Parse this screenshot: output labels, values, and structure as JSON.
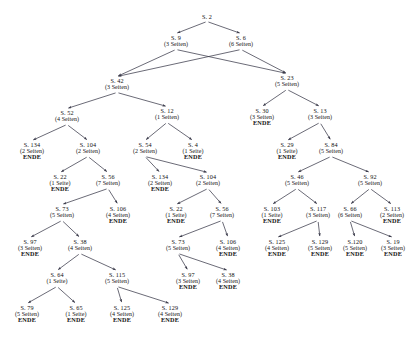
{
  "figure": {
    "caption_top": "",
    "caption_bottom": "",
    "edge_color": "#3a3a4a",
    "text_color": "#111111",
    "background_color": "#ffffff",
    "end_marker_label": "ENDE"
  },
  "chart_data": {
    "type": "tree",
    "title": "",
    "node_label_prefix": "S.",
    "pages_unit_singular": "Seite",
    "pages_unit_plural": "Seiten",
    "terminal_label": "ENDE"
  },
  "nodes": [
    {
      "id": "n0",
      "label": "S. 2",
      "pages": "",
      "end": "",
      "x": 207,
      "y": 14
    },
    {
      "id": "n1",
      "label": "S. 9",
      "pages": "(3 Seiten)",
      "end": "",
      "x": 176,
      "y": 35
    },
    {
      "id": "n2",
      "label": "S. 6",
      "pages": "(6 Seiten)",
      "end": "",
      "x": 241,
      "y": 35
    },
    {
      "id": "n3",
      "label": "S. 42",
      "pages": "(3 Seiten)",
      "end": "",
      "x": 117,
      "y": 78
    },
    {
      "id": "n4",
      "label": "S. 23",
      "pages": "(5 Seiten)",
      "end": "",
      "x": 287,
      "y": 75
    },
    {
      "id": "n5",
      "label": "S. 52",
      "pages": "(4 Seiten)",
      "end": "",
      "x": 67,
      "y": 110
    },
    {
      "id": "n6",
      "label": "S. 12",
      "pages": "(1 Seiten)",
      "end": "",
      "x": 167,
      "y": 108
    },
    {
      "id": "n7",
      "label": "S. 30",
      "pages": "(3 Seiten)",
      "end": "ENDE",
      "x": 262,
      "y": 108
    },
    {
      "id": "n8",
      "label": "S. 13",
      "pages": "(3 Seiten)",
      "end": "",
      "x": 320,
      "y": 108
    },
    {
      "id": "n9",
      "label": "S. 134",
      "pages": "(2 Seiten)",
      "end": "ENDE",
      "x": 32,
      "y": 142
    },
    {
      "id": "n10",
      "label": "S. 104",
      "pages": "(2 Seiten)",
      "end": "",
      "x": 88,
      "y": 142
    },
    {
      "id": "n11",
      "label": "S. 54",
      "pages": "(2 Seiten)",
      "end": "",
      "x": 145,
      "y": 142
    },
    {
      "id": "n12",
      "label": "S. 4",
      "pages": "(1 Seite)",
      "end": "ENDE",
      "x": 193,
      "y": 142
    },
    {
      "id": "n13",
      "label": "S. 29",
      "pages": "(1 Seite)",
      "end": "ENDE",
      "x": 287,
      "y": 142
    },
    {
      "id": "n14",
      "label": "S. 84",
      "pages": "(5 Seiten)",
      "end": "",
      "x": 331,
      "y": 142
    },
    {
      "id": "n15",
      "label": "S. 22",
      "pages": "(1 Seite)",
      "end": "ENDE",
      "x": 60,
      "y": 174
    },
    {
      "id": "n16",
      "label": "S. 56",
      "pages": "(7 Seiten)",
      "end": "",
      "x": 108,
      "y": 174
    },
    {
      "id": "n17",
      "label": "S. 134",
      "pages": "(2 Seiten)",
      "end": "ENDE",
      "x": 160,
      "y": 174
    },
    {
      "id": "n18",
      "label": "S. 104",
      "pages": "(2 Seiten)",
      "end": "",
      "x": 208,
      "y": 174
    },
    {
      "id": "n19",
      "label": "S. 46",
      "pages": "(5 Seiten)",
      "end": "",
      "x": 297,
      "y": 174
    },
    {
      "id": "n20",
      "label": "S. 92",
      "pages": "(5 Seiten)",
      "end": "",
      "x": 370,
      "y": 174
    },
    {
      "id": "n21",
      "label": "S. 73",
      "pages": "(5 Seiten)",
      "end": "",
      "x": 62,
      "y": 206
    },
    {
      "id": "n22",
      "label": "S. 106",
      "pages": "(4 Seiten)",
      "end": "ENDE",
      "x": 118,
      "y": 206
    },
    {
      "id": "n23",
      "label": "S. 22",
      "pages": "(1 Seite)",
      "end": "ENDE",
      "x": 176,
      "y": 206
    },
    {
      "id": "n24",
      "label": "S. 56",
      "pages": "(7 Seiten)",
      "end": "",
      "x": 222,
      "y": 206
    },
    {
      "id": "n25",
      "label": "S. 103",
      "pages": "(1 Seite)",
      "end": "ENDE",
      "x": 272,
      "y": 206
    },
    {
      "id": "n26",
      "label": "S. 117",
      "pages": "(3 Seiten)",
      "end": "",
      "x": 318,
      "y": 206
    },
    {
      "id": "n27",
      "label": "S. 66",
      "pages": "(6 Seiten)",
      "end": "",
      "x": 350,
      "y": 206
    },
    {
      "id": "n28",
      "label": "S. 113",
      "pages": "(2 Seiten)",
      "end": "ENDE",
      "x": 392,
      "y": 206
    },
    {
      "id": "n29",
      "label": "S. 97",
      "pages": "(3 Seiten)",
      "end": "ENDE",
      "x": 30,
      "y": 239
    },
    {
      "id": "n30",
      "label": "S. 38",
      "pages": "(4 Seiten)",
      "end": "",
      "x": 80,
      "y": 239
    },
    {
      "id": "n31",
      "label": "S. 73",
      "pages": "(5 Seiten)",
      "end": "",
      "x": 178,
      "y": 239
    },
    {
      "id": "n32",
      "label": "S. 106",
      "pages": "(4 Seiten)",
      "end": "ENDE",
      "x": 228,
      "y": 239
    },
    {
      "id": "n33",
      "label": "S. 125",
      "pages": "(4 Seiten)",
      "end": "ENDE",
      "x": 277,
      "y": 239
    },
    {
      "id": "n34",
      "label": "S. 129",
      "pages": "(5 Seiten)",
      "end": "ENDE",
      "x": 320,
      "y": 239
    },
    {
      "id": "n35",
      "label": "S.120",
      "pages": "(5 Seiten)",
      "end": "ENDE",
      "x": 355,
      "y": 239
    },
    {
      "id": "n36",
      "label": "S. 19",
      "pages": "(3 Seiten)",
      "end": "ENDE",
      "x": 393,
      "y": 239
    },
    {
      "id": "n37",
      "label": "S. 64",
      "pages": "(1 Seite)",
      "end": "",
      "x": 57,
      "y": 272
    },
    {
      "id": "n38",
      "label": "S. 115",
      "pages": "(5 Seiten)",
      "end": "",
      "x": 117,
      "y": 272
    },
    {
      "id": "n39",
      "label": "S. 97",
      "pages": "(3 Seiten)",
      "end": "ENDE",
      "x": 188,
      "y": 272
    },
    {
      "id": "n40",
      "label": "S. 38",
      "pages": "(4 Seiten)",
      "end": "ENDE",
      "x": 228,
      "y": 272
    },
    {
      "id": "n41",
      "label": "S. 79",
      "pages": "(5 Seiten)",
      "end": "ENDE",
      "x": 27,
      "y": 305
    },
    {
      "id": "n42",
      "label": "S. 65",
      "pages": "(1 Seite)",
      "end": "ENDE",
      "x": 76,
      "y": 305
    },
    {
      "id": "n43",
      "label": "S. 125",
      "pages": "(4 Seiten)",
      "end": "ENDE",
      "x": 122,
      "y": 305
    },
    {
      "id": "n44",
      "label": "S. 129",
      "pages": "(4 Seiten)",
      "end": "ENDE",
      "x": 170,
      "y": 305
    }
  ],
  "edges": [
    {
      "from": "n0",
      "to": "n1"
    },
    {
      "from": "n0",
      "to": "n2"
    },
    {
      "from": "n1",
      "to": "n3"
    },
    {
      "from": "n1",
      "to": "n4"
    },
    {
      "from": "n2",
      "to": "n3"
    },
    {
      "from": "n2",
      "to": "n4"
    },
    {
      "from": "n3",
      "to": "n5"
    },
    {
      "from": "n3",
      "to": "n6"
    },
    {
      "from": "n4",
      "to": "n7"
    },
    {
      "from": "n4",
      "to": "n8"
    },
    {
      "from": "n5",
      "to": "n9"
    },
    {
      "from": "n5",
      "to": "n10"
    },
    {
      "from": "n6",
      "to": "n11"
    },
    {
      "from": "n6",
      "to": "n12"
    },
    {
      "from": "n8",
      "to": "n13"
    },
    {
      "from": "n8",
      "to": "n14"
    },
    {
      "from": "n10",
      "to": "n15"
    },
    {
      "from": "n10",
      "to": "n16"
    },
    {
      "from": "n11",
      "to": "n17"
    },
    {
      "from": "n11",
      "to": "n18"
    },
    {
      "from": "n14",
      "to": "n19"
    },
    {
      "from": "n14",
      "to": "n20"
    },
    {
      "from": "n16",
      "to": "n21"
    },
    {
      "from": "n16",
      "to": "n22"
    },
    {
      "from": "n18",
      "to": "n23"
    },
    {
      "from": "n18",
      "to": "n24"
    },
    {
      "from": "n19",
      "to": "n25"
    },
    {
      "from": "n19",
      "to": "n26"
    },
    {
      "from": "n20",
      "to": "n27"
    },
    {
      "from": "n20",
      "to": "n28"
    },
    {
      "from": "n21",
      "to": "n29"
    },
    {
      "from": "n21",
      "to": "n30"
    },
    {
      "from": "n24",
      "to": "n31"
    },
    {
      "from": "n24",
      "to": "n32"
    },
    {
      "from": "n26",
      "to": "n33"
    },
    {
      "from": "n26",
      "to": "n34"
    },
    {
      "from": "n27",
      "to": "n35"
    },
    {
      "from": "n27",
      "to": "n36"
    },
    {
      "from": "n30",
      "to": "n37"
    },
    {
      "from": "n30",
      "to": "n38"
    },
    {
      "from": "n31",
      "to": "n39"
    },
    {
      "from": "n31",
      "to": "n40"
    },
    {
      "from": "n37",
      "to": "n41"
    },
    {
      "from": "n37",
      "to": "n42"
    },
    {
      "from": "n38",
      "to": "n43"
    },
    {
      "from": "n38",
      "to": "n44"
    }
  ]
}
